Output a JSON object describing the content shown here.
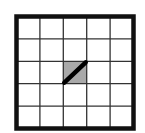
{
  "diagram": {
    "type": "grid",
    "rows": 5,
    "cols": 5,
    "border_color": "#111111",
    "line_color": "#333333",
    "background": "#ffffff",
    "highlighted_cell": {
      "row": 2,
      "col": 2,
      "fill": "#a9a9a9",
      "diagonal": "bottom-left-to-top-right",
      "diagonal_color": "#000000"
    }
  }
}
